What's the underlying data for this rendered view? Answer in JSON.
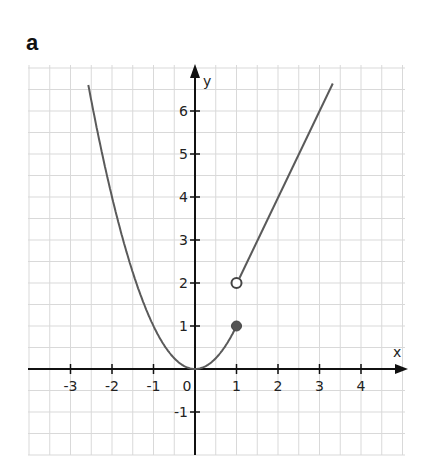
{
  "panel": {
    "label": "a"
  },
  "axes": {
    "x_name": "x",
    "y_name": "y",
    "x_ticks": [
      "-3",
      "-2",
      "-1",
      "0",
      "1",
      "2",
      "3",
      "4"
    ],
    "y_ticks": [
      "-1",
      "1",
      "2",
      "3",
      "4",
      "5",
      "6"
    ]
  },
  "colors": {
    "curve": "#5a5a5a",
    "axis": "#111111",
    "grid": "#d9d9d9"
  },
  "chart_data": {
    "type": "line",
    "title": "a",
    "xlabel": "x",
    "ylabel": "y",
    "xlim": [
      -4,
      5
    ],
    "ylim": [
      -2,
      7
    ],
    "grid": true,
    "grid_step": 0.5,
    "x_ticks": [
      -3,
      -2,
      -1,
      0,
      1,
      2,
      3,
      4
    ],
    "y_ticks": [
      -1,
      1,
      2,
      3,
      4,
      5,
      6
    ],
    "series": [
      {
        "name": "y = x^2 (x <= 1)",
        "type": "line",
        "x": [
          -2.15,
          -2,
          -1.5,
          -1,
          -0.5,
          0,
          0.5,
          1
        ],
        "y": [
          4.62,
          4,
          2.25,
          1,
          0.25,
          0,
          0.25,
          1
        ],
        "note": "curve continues above plot area for x < -2.15 (up to y~6.6 at x~-2.6)",
        "endpoint": {
          "x": 1,
          "y": 1,
          "marker": "closed"
        }
      },
      {
        "name": "y = 2x (x > 1)",
        "type": "line",
        "x": [
          1,
          2,
          3,
          3.3
        ],
        "y": [
          2,
          4,
          6,
          6.6
        ],
        "endpoint": {
          "x": 1,
          "y": 2,
          "marker": "open"
        }
      }
    ]
  }
}
